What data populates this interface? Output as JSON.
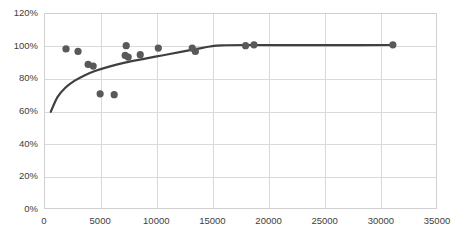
{
  "chart_data": {
    "type": "scatter",
    "title": "",
    "xlabel": "",
    "ylabel": "",
    "xlim": [
      0,
      35000
    ],
    "ylim": [
      0,
      1.2
    ],
    "grid": true,
    "legend": false,
    "x_ticks": [
      0,
      5000,
      10000,
      15000,
      20000,
      25000,
      30000,
      35000
    ],
    "x_tick_labels": [
      "0",
      "5000",
      "10000",
      "15000",
      "20000",
      "25000",
      "30000",
      "35000"
    ],
    "y_ticks": [
      0,
      0.2,
      0.4,
      0.6,
      0.8,
      1.0,
      1.2
    ],
    "y_tick_labels": [
      "0%",
      "20%",
      "40%",
      "60%",
      "80%",
      "100%",
      "120%"
    ],
    "marker_color": "#595959",
    "line_color": "#404040",
    "series": [
      {
        "name": "observations",
        "type": "scatter",
        "points": [
          {
            "x": 1960,
            "y": 0.98
          },
          {
            "x": 3030,
            "y": 0.965
          },
          {
            "x": 3930,
            "y": 0.885
          },
          {
            "x": 4380,
            "y": 0.875
          },
          {
            "x": 5000,
            "y": 0.705
          },
          {
            "x": 6250,
            "y": 0.7
          },
          {
            "x": 7230,
            "y": 0.94
          },
          {
            "x": 7320,
            "y": 1.0
          },
          {
            "x": 7500,
            "y": 0.93
          },
          {
            "x": 8570,
            "y": 0.945
          },
          {
            "x": 10180,
            "y": 0.985
          },
          {
            "x": 13200,
            "y": 0.985
          },
          {
            "x": 13480,
            "y": 0.965
          },
          {
            "x": 17950,
            "y": 1.0
          },
          {
            "x": 18700,
            "y": 1.005
          },
          {
            "x": 31070,
            "y": 1.005
          }
        ]
      },
      {
        "name": "fitted-curve",
        "type": "line",
        "points": [
          {
            "x": 600,
            "y": 0.595
          },
          {
            "x": 1200,
            "y": 0.685
          },
          {
            "x": 1900,
            "y": 0.742
          },
          {
            "x": 2700,
            "y": 0.784
          },
          {
            "x": 3600,
            "y": 0.818
          },
          {
            "x": 4600,
            "y": 0.846
          },
          {
            "x": 5800,
            "y": 0.872
          },
          {
            "x": 7200,
            "y": 0.896
          },
          {
            "x": 8800,
            "y": 0.918
          },
          {
            "x": 10500,
            "y": 0.94
          },
          {
            "x": 12200,
            "y": 0.962
          },
          {
            "x": 13600,
            "y": 0.98
          },
          {
            "x": 14800,
            "y": 0.995
          },
          {
            "x": 15800,
            "y": 1.002
          },
          {
            "x": 18000,
            "y": 1.004
          },
          {
            "x": 22000,
            "y": 1.003
          },
          {
            "x": 26000,
            "y": 1.003
          },
          {
            "x": 31100,
            "y": 1.004
          }
        ]
      }
    ]
  },
  "axis": {
    "plot_left_px": 44,
    "plot_top_px": 13,
    "plot_width_px": 393,
    "plot_height_px": 196
  }
}
